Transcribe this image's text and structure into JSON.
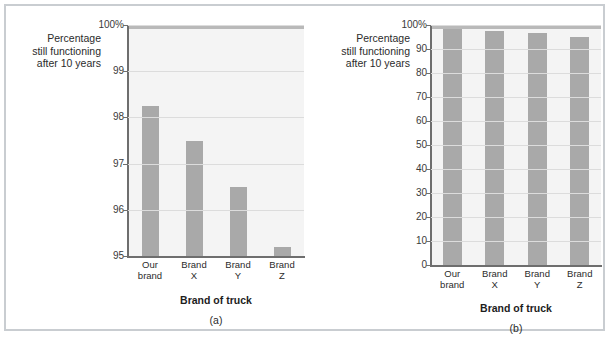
{
  "figure": {
    "border_color": "#c9cdd1",
    "background": "#ffffff",
    "bar_color": "#a9a9a9",
    "plot_background": "#f4f4f4",
    "grid_color": "#dcdcdc",
    "axis_color": "#6e6e6e"
  },
  "panel_a": {
    "caption": "(a)",
    "ytitle_line1": "Percentage",
    "ytitle_line2": "still functioning",
    "ytitle_line3": "after 10 years",
    "xlabel_title": "Brand of truck",
    "yticks": [
      "100%",
      "99",
      "98",
      "97",
      "96",
      "95"
    ],
    "xticks_l1": [
      "Our",
      "Brand",
      "Brand",
      "Brand"
    ],
    "xticks_l2": [
      "brand",
      "X",
      "Y",
      "Z"
    ]
  },
  "panel_b": {
    "caption": "(b)",
    "ytitle_line1": "Percentage",
    "ytitle_line2": "still functioning",
    "ytitle_line3": "after 10 years",
    "xlabel_title": "Brand of truck",
    "yticks": [
      "100%",
      "90",
      "80",
      "70",
      "60",
      "50",
      "40",
      "30",
      "20",
      "10",
      "0"
    ],
    "xticks_l1": [
      "Our",
      "Brand",
      "Brand",
      "Brand"
    ],
    "xticks_l2": [
      "brand",
      "X",
      "Y",
      "Z"
    ]
  },
  "chart_data": [
    {
      "type": "bar",
      "panel": "(a)",
      "title": "",
      "xlabel": "Brand of truck",
      "ylabel": "Percentage still functioning after 10 years",
      "categories": [
        "Our brand",
        "Brand X",
        "Brand Y",
        "Brand Z"
      ],
      "values": [
        98.25,
        97.5,
        96.5,
        95.2
      ],
      "ylim": [
        95,
        100
      ],
      "yticks": [
        95,
        96,
        97,
        98,
        99,
        100
      ],
      "ytick_labels": [
        "95",
        "96",
        "97",
        "98",
        "99",
        "100%"
      ],
      "grid": true,
      "legend": "none",
      "note": "Truncated y-axis starting at 95 exaggerates differences between brands"
    },
    {
      "type": "bar",
      "panel": "(b)",
      "title": "",
      "xlabel": "Brand of truck",
      "ylabel": "Percentage still functioning after 10 years",
      "categories": [
        "Our brand",
        "Brand X",
        "Brand Y",
        "Brand Z"
      ],
      "values": [
        98.25,
        97.5,
        96.5,
        95.2
      ],
      "ylim": [
        0,
        100
      ],
      "yticks": [
        0,
        10,
        20,
        30,
        40,
        50,
        60,
        70,
        80,
        90,
        100
      ],
      "ytick_labels": [
        "0",
        "10",
        "20",
        "30",
        "40",
        "50",
        "60",
        "70",
        "80",
        "90",
        "100%"
      ],
      "grid": true,
      "legend": "none",
      "note": "Full y-axis from 0 shows the brands are nearly identical"
    }
  ]
}
